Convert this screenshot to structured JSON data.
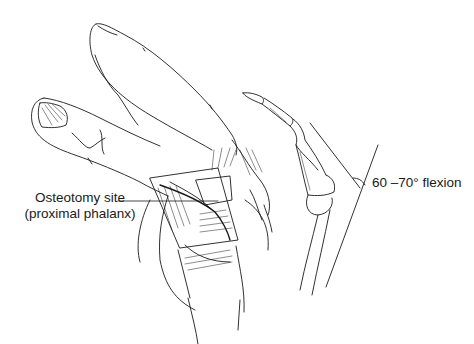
{
  "figure": {
    "ink_color": "#1a1a1a",
    "background": "#ffffff"
  },
  "labels": {
    "osteotomy_line1": "Osteotomy site",
    "osteotomy_line2": "(proximal phalanx)",
    "flexion": "60 –70° flexion"
  }
}
